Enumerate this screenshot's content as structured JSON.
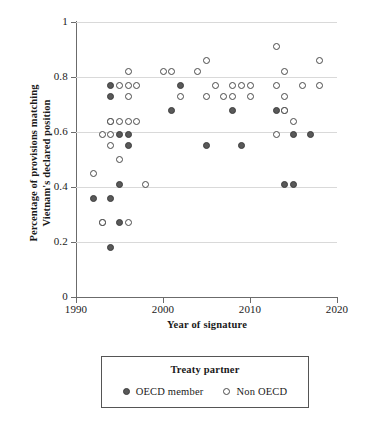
{
  "chart_data": {
    "type": "scatter",
    "title": "",
    "xlabel": "Year of signature",
    "ylabel": "Percentage of provisions matching Vietnam's declared position",
    "ylabel_line1": "Percentage of provisions matching",
    "ylabel_line2": "Vietnam's declared position",
    "xlim": [
      1990,
      2020
    ],
    "ylim": [
      0,
      1
    ],
    "xticks": [
      1990,
      2000,
      2010,
      2020
    ],
    "xtick_labels": [
      "1990",
      "2000",
      "2010",
      "2020"
    ],
    "yticks": [
      0,
      0.2,
      0.4,
      0.6,
      0.8,
      1
    ],
    "ytick_labels": [
      "0",
      "0.2",
      "0.4",
      "0.6",
      "0.8",
      "1"
    ],
    "grid": "horizontal",
    "legend": {
      "title": "Treaty partner",
      "position": "below-plot",
      "entries": [
        {
          "label": "OECD member",
          "marker": "filled-circle",
          "color": "#595959"
        },
        {
          "label": "Non OECD",
          "marker": "open-circle",
          "color": "#ffffff"
        }
      ]
    },
    "series": [
      {
        "name": "OECD member",
        "marker": "filled-circle",
        "color": "#595959",
        "points": [
          {
            "x": 1992,
            "y": 0.36
          },
          {
            "x": 1993,
            "y": 0.27
          },
          {
            "x": 1994,
            "y": 0.77
          },
          {
            "x": 1994,
            "y": 0.73
          },
          {
            "x": 1994,
            "y": 0.64
          },
          {
            "x": 1994,
            "y": 0.36
          },
          {
            "x": 1994,
            "y": 0.18
          },
          {
            "x": 1995,
            "y": 0.59
          },
          {
            "x": 1995,
            "y": 0.41
          },
          {
            "x": 1995,
            "y": 0.27
          },
          {
            "x": 1996,
            "y": 0.59
          },
          {
            "x": 1996,
            "y": 0.55
          },
          {
            "x": 2001,
            "y": 0.68
          },
          {
            "x": 2002,
            "y": 0.77
          },
          {
            "x": 2005,
            "y": 0.55
          },
          {
            "x": 2008,
            "y": 0.68
          },
          {
            "x": 2009,
            "y": 0.55
          },
          {
            "x": 2013,
            "y": 0.68
          },
          {
            "x": 2014,
            "y": 0.68
          },
          {
            "x": 2014,
            "y": 0.41
          },
          {
            "x": 2015,
            "y": 0.59
          },
          {
            "x": 2015,
            "y": 0.41
          },
          {
            "x": 2017,
            "y": 0.59
          }
        ]
      },
      {
        "name": "Non OECD",
        "marker": "open-circle",
        "color": "#ffffff",
        "points": [
          {
            "x": 1992,
            "y": 0.45
          },
          {
            "x": 1993,
            "y": 0.59
          },
          {
            "x": 1993,
            "y": 0.27
          },
          {
            "x": 1994,
            "y": 0.64
          },
          {
            "x": 1994,
            "y": 0.59
          },
          {
            "x": 1994,
            "y": 0.55
          },
          {
            "x": 1995,
            "y": 0.64
          },
          {
            "x": 1995,
            "y": 0.5
          },
          {
            "x": 1995,
            "y": 0.77
          },
          {
            "x": 1996,
            "y": 0.82
          },
          {
            "x": 1996,
            "y": 0.77
          },
          {
            "x": 1996,
            "y": 0.73
          },
          {
            "x": 1996,
            "y": 0.64
          },
          {
            "x": 1996,
            "y": 0.27
          },
          {
            "x": 1997,
            "y": 0.77
          },
          {
            "x": 1997,
            "y": 0.64
          },
          {
            "x": 1998,
            "y": 0.41
          },
          {
            "x": 2000,
            "y": 0.82
          },
          {
            "x": 2001,
            "y": 0.82
          },
          {
            "x": 2002,
            "y": 0.73
          },
          {
            "x": 2004,
            "y": 0.82
          },
          {
            "x": 2005,
            "y": 0.86
          },
          {
            "x": 2005,
            "y": 0.73
          },
          {
            "x": 2006,
            "y": 0.77
          },
          {
            "x": 2007,
            "y": 0.73
          },
          {
            "x": 2008,
            "y": 0.77
          },
          {
            "x": 2008,
            "y": 0.73
          },
          {
            "x": 2009,
            "y": 0.77
          },
          {
            "x": 2010,
            "y": 0.77
          },
          {
            "x": 2010,
            "y": 0.73
          },
          {
            "x": 2013,
            "y": 0.91
          },
          {
            "x": 2013,
            "y": 0.77
          },
          {
            "x": 2013,
            "y": 0.59
          },
          {
            "x": 2014,
            "y": 0.82
          },
          {
            "x": 2014,
            "y": 0.73
          },
          {
            "x": 2014,
            "y": 0.68
          },
          {
            "x": 2015,
            "y": 0.64
          },
          {
            "x": 2016,
            "y": 0.77
          },
          {
            "x": 2018,
            "y": 0.86
          },
          {
            "x": 2018,
            "y": 0.77
          }
        ]
      }
    ]
  }
}
